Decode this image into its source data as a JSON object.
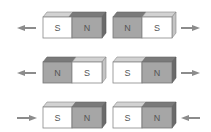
{
  "rows": [
    {
      "magnets": [
        {
          "left": "S",
          "right": "N"
        },
        {
          "left": "N",
          "right": "S"
        }
      ],
      "arrows": {
        "left": "outward",
        "right": "outward"
      }
    },
    {
      "magnets": [
        {
          "left": "N",
          "right": "S"
        },
        {
          "left": "S",
          "right": "N"
        }
      ],
      "arrows": {
        "left": "outward",
        "right": "outward"
      }
    },
    {
      "magnets": [
        {
          "left": "S",
          "right": "N"
        },
        {
          "left": "S",
          "right": "N"
        }
      ],
      "arrows": {
        "left": "inward",
        "right": "inward"
      }
    }
  ],
  "colors": {
    "north": "#a8a8a8",
    "south": "#ffffff",
    "arrow": "#8c8c8c"
  }
}
